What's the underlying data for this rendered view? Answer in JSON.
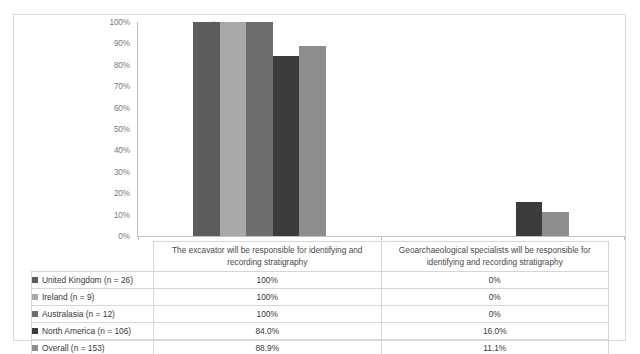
{
  "chart_data": {
    "type": "bar",
    "title": "",
    "subtitle": "",
    "xlabel": "",
    "ylabel": "",
    "ylim": [
      0,
      100
    ],
    "grid": false,
    "legend_position": "table-left",
    "orientation": "vertical",
    "value_suffix": "%",
    "categories": [
      "The excavator will be responsible for identifying and recording stratigraphy",
      "Geoarchaeological specialists will be responsible for identifying and recording stratigraphy"
    ],
    "yticks": [
      "0%",
      "10%",
      "20%",
      "30%",
      "40%",
      "50%",
      "60%",
      "70%",
      "80%",
      "90%",
      "100%"
    ],
    "ytick_values": [
      0,
      10,
      20,
      30,
      40,
      50,
      60,
      70,
      80,
      90,
      100
    ],
    "series": [
      {
        "name": "United Kingdom (n = 26)",
        "color": "#5c5c5c",
        "values": [
          100,
          0
        ],
        "labels": [
          "100%",
          "0%"
        ]
      },
      {
        "name": "Ireland (n = 9)",
        "color": "#a9a9a9",
        "values": [
          100,
          0
        ],
        "labels": [
          "100%",
          "0%"
        ]
      },
      {
        "name": "Australasia (n = 12)",
        "color": "#6e6e6e",
        "values": [
          100,
          0
        ],
        "labels": [
          "100%",
          "0%"
        ]
      },
      {
        "name": "North America (n = 106)",
        "color": "#3b3b3b",
        "values": [
          84.0,
          16.0
        ],
        "labels": [
          "84.0%",
          "16.0%"
        ]
      },
      {
        "name": "Overall (n = 153)",
        "color": "#8d8d8d",
        "values": [
          88.9,
          11.1
        ],
        "labels": [
          "88.9%",
          "11.1%"
        ]
      }
    ]
  },
  "table": {
    "legend_header": "",
    "column_headers": [
      "The excavator will be responsible for identifying and recording stratigraphy",
      "Geoarchaeological specialists will be responsible for identifying and recording stratigraphy"
    ],
    "rows": [
      {
        "label": "United Kingdom (n = 26)",
        "swatch": "#5c5c5c",
        "values": [
          "100%",
          "0%"
        ]
      },
      {
        "label": "Ireland (n = 9)",
        "swatch": "#a9a9a9",
        "values": [
          "100%",
          "0%"
        ]
      },
      {
        "label": "Australasia (n = 12)",
        "swatch": "#6e6e6e",
        "values": [
          "100%",
          "0%"
        ]
      },
      {
        "label": "North America (n = 106)",
        "swatch": "#3b3b3b",
        "values": [
          "84.0%",
          "16.0%"
        ]
      },
      {
        "label": "Overall (n = 153)",
        "swatch": "#8d8d8d",
        "values": [
          "88.9%",
          "11.1%"
        ]
      }
    ]
  }
}
